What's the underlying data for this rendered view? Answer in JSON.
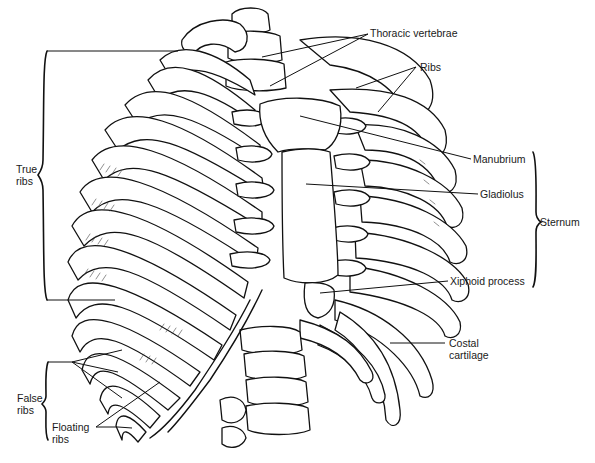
{
  "figure": {
    "labels": {
      "thoracic_vertebrae": "Thoracic vertebrae",
      "ribs": "Ribs",
      "manubrium": "Manubrium",
      "gladiolus": "Gladiolus",
      "sternum": "Sternum",
      "xiphoid_process": "Xiphoid process",
      "costal_cartilage_line1": "Costal",
      "costal_cartilage_line2": "cartilage",
      "true_ribs_line1": "True",
      "true_ribs_line2": "ribs",
      "false_ribs_line1": "False",
      "false_ribs_line2": "ribs",
      "floating_ribs_line1": "Floating",
      "floating_ribs_line2": "ribs"
    },
    "brackets": {
      "true_ribs": {
        "side": "left",
        "top_y": 51,
        "bottom_y": 300
      },
      "false_ribs": {
        "side": "left",
        "top_y": 360,
        "bottom_y": 440
      },
      "sternum": {
        "side": "right",
        "top_y": 152,
        "bottom_y": 287
      }
    },
    "colors": {
      "ink": "#111111",
      "background": "#ffffff"
    }
  }
}
